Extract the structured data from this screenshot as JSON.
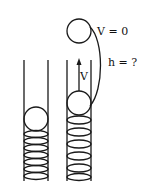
{
  "diagram": {
    "labels": {
      "top_velocity": "V = 0",
      "height": "h = ?",
      "launch_velocity": "V"
    },
    "colors": {
      "stroke": "#1a1a1a",
      "background": "#ffffff"
    },
    "elements": {
      "left_tube": "compressed spring with ball",
      "right_tube": "released spring launching ball",
      "top_ball": "ball at maximum height"
    }
  }
}
